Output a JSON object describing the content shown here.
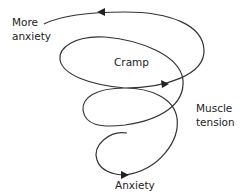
{
  "diagram": {
    "type": "spiral",
    "labels": {
      "more_anxiety": [
        "More",
        "anxiety"
      ],
      "cramp": "Cramp",
      "muscle_tension": [
        "Muscle",
        "tension"
      ],
      "anxiety": "Anxiety"
    },
    "stroke_color": "#333333"
  }
}
